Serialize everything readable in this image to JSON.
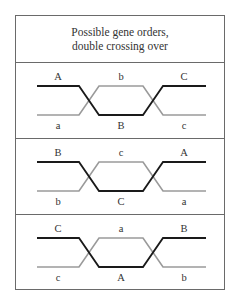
{
  "title": {
    "line1": "Possible gene orders,",
    "line2": "double crossing over"
  },
  "colors": {
    "dark_strand": "#1a1a1a",
    "light_strand": "#9a9a9a",
    "border": "#6a6a6a"
  },
  "sections": [
    {
      "top_labels": [
        "A",
        "b",
        "C"
      ],
      "bottom_labels": [
        "a",
        "B",
        "c"
      ]
    },
    {
      "top_labels": [
        "B",
        "c",
        "A"
      ],
      "bottom_labels": [
        "b",
        "C",
        "a"
      ]
    },
    {
      "top_labels": [
        "C",
        "a",
        "B"
      ],
      "bottom_labels": [
        "c",
        "A",
        "b"
      ]
    }
  ]
}
